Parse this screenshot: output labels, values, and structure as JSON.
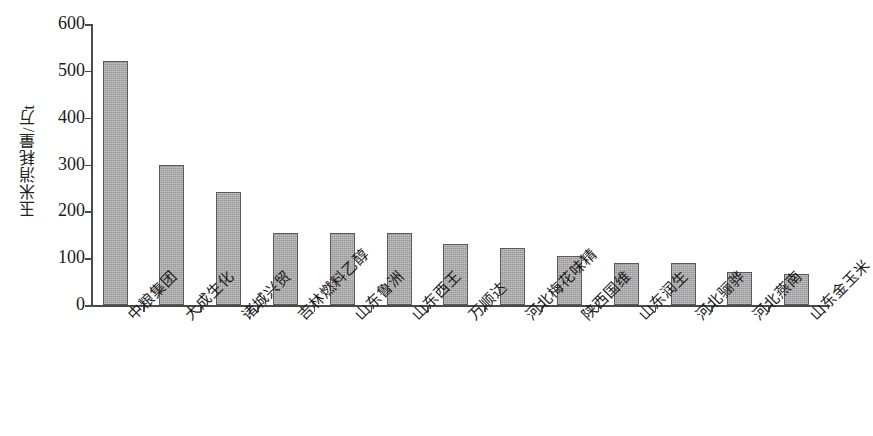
{
  "chart_data": {
    "type": "bar",
    "title": "",
    "subtitle": "",
    "xlabel": "",
    "ylabel": "玉米消耗量/万t",
    "ylim": [
      0,
      600
    ],
    "ytick_values": [
      0,
      100,
      200,
      300,
      400,
      500,
      600
    ],
    "ytick_labels": [
      "0",
      "100",
      "200",
      "300",
      "400",
      "500",
      "600"
    ],
    "grid": false,
    "legend": null,
    "legend_position": "none",
    "bar_color": "#a9a9a9",
    "bar_edge_color": "#5a5a5a",
    "axis_color": "#4a4a4a",
    "categories": [
      "中粮集团",
      "大成生化",
      "诸城兴贸",
      "吉林燃料乙醇",
      "山东鲁洲",
      "山东西王",
      "万顺达",
      "河北梅花味精",
      "陕西国维",
      "山东润生",
      "河北骊骅",
      "河北燕南",
      "山东金玉米"
    ],
    "values": [
      522,
      300,
      242,
      153,
      153,
      153,
      130,
      122,
      104,
      90,
      89,
      70,
      67
    ],
    "annotations": []
  }
}
